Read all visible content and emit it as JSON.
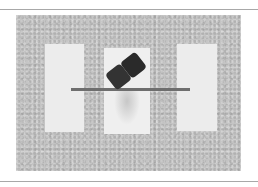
{
  "figure": {
    "colors": {
      "background": "#c4c4c4",
      "panel": "#ececec",
      "rod": "#6e6e6e",
      "block": "#2e2e2e",
      "rule": "#a8a8a8"
    }
  }
}
